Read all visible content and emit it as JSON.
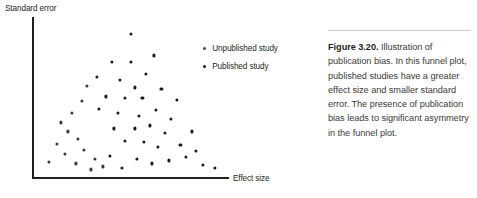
{
  "figure": {
    "caption_label": "Figure 3.20.",
    "caption_body": " Illustration of publication bias. In this funnel plot, published studies have a greater effect size and smaller standard error. The presence of publication bias leads to significant asymmetry in the funnel plot.",
    "rule_color": "#c9c9c9"
  },
  "legend": {
    "items": [
      {
        "label": "Unpublished study",
        "marker": "dot-marker",
        "color": "#4a4a4a"
      },
      {
        "label": "Published study",
        "marker": "dot-marker",
        "color": "#1a1a1a"
      }
    ]
  },
  "chart_data": {
    "type": "scatter",
    "title": "",
    "xlabel": "Effect size",
    "ylabel": "Standard error",
    "xlim": [
      0,
      100
    ],
    "ylim": [
      0,
      100
    ],
    "grid": false,
    "legend_position": "upper-right-inside",
    "axis_color": "#231f20",
    "marker_color": "#1a1a1a",
    "note": "Funnel plot; y axis increases downward in data terms (standard error largest at bottom). Coordinates below are normalized percentages of the plot box: x 0-100 left-to-right, y 0-100 top-to-bottom.",
    "series": [
      {
        "name": "Unpublished study",
        "color": "#4a4a4a",
        "points": [
          {
            "x": 27,
            "y": 42
          },
          {
            "x": 24,
            "y": 52
          },
          {
            "x": 19,
            "y": 60
          },
          {
            "x": 13,
            "y": 66
          },
          {
            "x": 17,
            "y": 72
          },
          {
            "x": 22,
            "y": 77
          },
          {
            "x": 11,
            "y": 80
          },
          {
            "x": 25,
            "y": 84
          },
          {
            "x": 15,
            "y": 87
          },
          {
            "x": 7,
            "y": 92
          },
          {
            "x": 21,
            "y": 93
          },
          {
            "x": 31,
            "y": 90
          },
          {
            "x": 35,
            "y": 95
          },
          {
            "x": 29,
            "y": 97
          }
        ]
      },
      {
        "name": "Published study",
        "color": "#1a1a1a",
        "points": [
          {
            "x": 50,
            "y": 8
          },
          {
            "x": 62,
            "y": 22
          },
          {
            "x": 40,
            "y": 26
          },
          {
            "x": 50,
            "y": 26
          },
          {
            "x": 32,
            "y": 36
          },
          {
            "x": 44,
            "y": 38
          },
          {
            "x": 58,
            "y": 34
          },
          {
            "x": 52,
            "y": 43
          },
          {
            "x": 66,
            "y": 44
          },
          {
            "x": 37,
            "y": 49
          },
          {
            "x": 47,
            "y": 50
          },
          {
            "x": 56,
            "y": 50
          },
          {
            "x": 74,
            "y": 51
          },
          {
            "x": 33,
            "y": 57
          },
          {
            "x": 43,
            "y": 60
          },
          {
            "x": 54,
            "y": 62
          },
          {
            "x": 63,
            "y": 58
          },
          {
            "x": 71,
            "y": 64
          },
          {
            "x": 41,
            "y": 70
          },
          {
            "x": 52,
            "y": 70
          },
          {
            "x": 60,
            "y": 68
          },
          {
            "x": 68,
            "y": 73
          },
          {
            "x": 82,
            "y": 72
          },
          {
            "x": 47,
            "y": 78
          },
          {
            "x": 57,
            "y": 79
          },
          {
            "x": 64,
            "y": 82
          },
          {
            "x": 76,
            "y": 81
          },
          {
            "x": 84,
            "y": 85
          },
          {
            "x": 39,
            "y": 88
          },
          {
            "x": 53,
            "y": 90
          },
          {
            "x": 61,
            "y": 93
          },
          {
            "x": 70,
            "y": 91
          },
          {
            "x": 79,
            "y": 89
          },
          {
            "x": 88,
            "y": 94
          },
          {
            "x": 45,
            "y": 96
          },
          {
            "x": 94,
            "y": 96
          }
        ]
      }
    ]
  }
}
